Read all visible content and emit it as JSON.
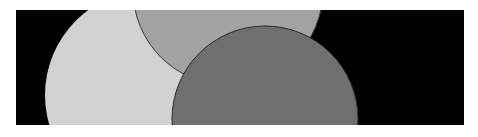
{
  "image": {
    "background_color": "#000000",
    "frame_color": "#ffffff",
    "shapes": [
      {
        "name": "light-circle",
        "cx": 134,
        "cy": 85,
        "r": 105,
        "fill": "#d2d2d2",
        "stroke": "none"
      },
      {
        "name": "medium-circle",
        "cx": 212,
        "cy": -20,
        "r": 95,
        "fill": "#a3a3a3",
        "stroke": "#3a3a3a"
      },
      {
        "name": "dark-circle",
        "cx": 249,
        "cy": 109,
        "r": 93,
        "fill": "#6f6f6f",
        "stroke": "#2a2a2a"
      }
    ]
  }
}
